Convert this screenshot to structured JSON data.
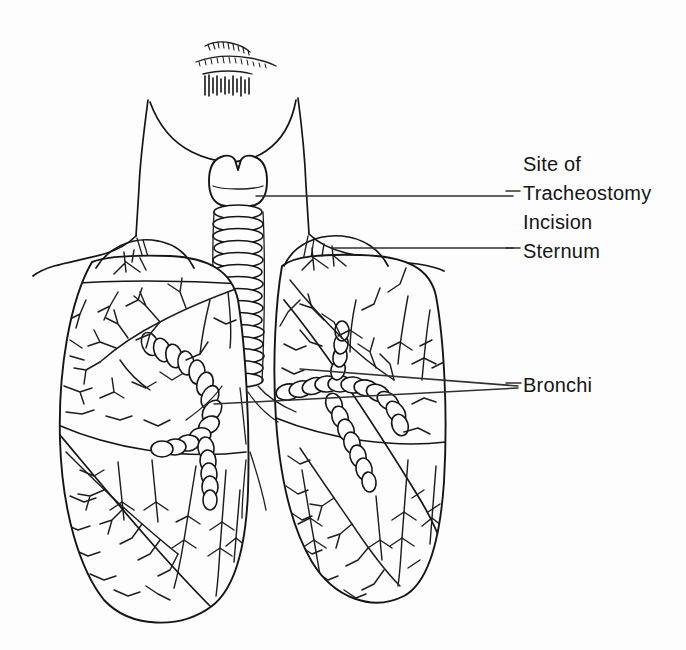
{
  "figure": {
    "style": "hand-drawn black ink line art",
    "background_color": "#fdfdfd",
    "ink_color": "#151515",
    "leader_line_color": "#303030"
  },
  "labels": {
    "site_of": "Site of",
    "tracheostomy": "Tracheostomy",
    "incision": "Incision",
    "sternum": "Sternum",
    "bronchi": "Bronchi"
  },
  "annotations": [
    {
      "name": "tracheostomy-incision",
      "text": "Site of Tracheostomy Incision",
      "leader_from": [
        513,
        196
      ],
      "leader_to": [
        255,
        196
      ],
      "target": "trachea just below larynx"
    },
    {
      "name": "sternum",
      "text": "Sternum",
      "leader_from": [
        513,
        248
      ],
      "leader_to": [
        330,
        248
      ],
      "target": "sternum / upper chest midline"
    },
    {
      "name": "bronchi-upper",
      "text": "Bronchi",
      "leader_from": [
        518,
        386
      ],
      "leader_to": [
        300,
        370
      ],
      "target": "right main bronchus"
    },
    {
      "name": "bronchi-lower",
      "text": "Bronchi",
      "leader_from": [
        518,
        388
      ],
      "leader_to": [
        215,
        404
      ],
      "target": "left main bronchus"
    }
  ],
  "anatomy": {
    "parts": [
      "chin",
      "mouth hatching",
      "neck",
      "shoulders",
      "clavicles",
      "larynx",
      "trachea",
      "carina",
      "left main bronchus",
      "right main bronchus",
      "left lung",
      "right lung",
      "pulmonary vasculature"
    ],
    "trachea_ring_count": 17,
    "lung_count": 2
  }
}
